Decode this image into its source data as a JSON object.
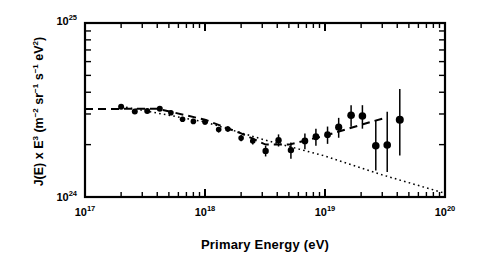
{
  "figure": {
    "kind": "scientific-plot",
    "xlabel": "Primary Energy (eV)",
    "ylabel_plain": "J(E) x E3 (m-2 sr-1 s-1 eV2)"
  },
  "ylabel_parts": {
    "j": "J(E) x E",
    "j_exp": "3",
    "open": " (m",
    "m_exp": "−2",
    "sr": " sr",
    "sr_exp": "−1",
    "s": " s",
    "s_exp": "−1",
    "ev": " eV",
    "ev_exp": "2",
    "close": ")"
  },
  "chart_data": {
    "type": "scatter",
    "title": "",
    "xlabel": "Primary Energy (eV)",
    "ylabel": "J(E) x E^3 (m^-2 sr^-1 s^-1 eV^2)",
    "xscale": "log",
    "yscale": "log",
    "xlim": [
      1e+17,
      1e+20
    ],
    "ylim": [
      1e+24,
      1e+25
    ],
    "xticks": [
      1e+17,
      1e+18,
      1e+19,
      1e+20
    ],
    "xticklabels": [
      "10^17",
      "10^18",
      "10^19",
      "10^20"
    ],
    "yticks": [
      1e+24,
      1e+25
    ],
    "yticklabels": [
      "10^24",
      "10^25"
    ],
    "grid": false,
    "legend": false,
    "marker": "filled-circle",
    "errorbars": "vertical, no caps",
    "points": [
      {
        "x": 2e+17,
        "y": 3.3e+24,
        "yerr_lo": 1e+23,
        "yerr_hi": 1e+23,
        "r": 3.0
      },
      {
        "x": 2.6e+17,
        "y": 3.1e+24,
        "yerr_lo": 9e+22,
        "yerr_hi": 9e+22,
        "r": 3.0
      },
      {
        "x": 3.3e+17,
        "y": 3.12e+24,
        "yerr_lo": 9e+22,
        "yerr_hi": 9e+22,
        "r": 3.0
      },
      {
        "x": 4.2e+17,
        "y": 3.22e+24,
        "yerr_lo": 9e+22,
        "yerr_hi": 9e+22,
        "r": 3.0
      },
      {
        "x": 5.2e+17,
        "y": 3.05e+24,
        "yerr_lo": 9e+22,
        "yerr_hi": 9e+22,
        "r": 2.8
      },
      {
        "x": 6.5e+17,
        "y": 2.8e+24,
        "yerr_lo": 9e+22,
        "yerr_hi": 9e+22,
        "r": 2.8
      },
      {
        "x": 8e+17,
        "y": 2.72e+24,
        "yerr_lo": 9e+22,
        "yerr_hi": 9e+22,
        "r": 2.8
      },
      {
        "x": 1e+18,
        "y": 2.7e+24,
        "yerr_lo": 9e+22,
        "yerr_hi": 9e+22,
        "r": 2.8
      },
      {
        "x": 1.3e+18,
        "y": 2.44e+24,
        "yerr_lo": 9e+22,
        "yerr_hi": 9e+22,
        "r": 2.8
      },
      {
        "x": 1.55e+18,
        "y": 2.46e+24,
        "yerr_lo": 9e+22,
        "yerr_hi": 9e+22,
        "r": 2.8
      },
      {
        "x": 2e+18,
        "y": 2.18e+24,
        "yerr_lo": 9e+22,
        "yerr_hi": 9e+22,
        "r": 2.8
      },
      {
        "x": 2.5e+18,
        "y": 2.1e+24,
        "yerr_lo": 1e+23,
        "yerr_hi": 1e+23,
        "r": 2.8
      },
      {
        "x": 3.2e+18,
        "y": 1.84e+24,
        "yerr_lo": 1.3e+23,
        "yerr_hi": 1.3e+23,
        "r": 3.2
      },
      {
        "x": 4.1e+18,
        "y": 2.12e+24,
        "yerr_lo": 1.7e+23,
        "yerr_hi": 1.7e+23,
        "r": 3.2
      },
      {
        "x": 5.2e+18,
        "y": 1.86e+24,
        "yerr_lo": 2e+23,
        "yerr_hi": 2e+23,
        "r": 3.2
      },
      {
        "x": 6.8e+18,
        "y": 2.1e+24,
        "yerr_lo": 2.2e+23,
        "yerr_hi": 2.2e+23,
        "r": 3.4
      },
      {
        "x": 8.4e+18,
        "y": 2.22e+24,
        "yerr_lo": 2.5e+23,
        "yerr_hi": 2.5e+23,
        "r": 3.4
      },
      {
        "x": 1.05e+19,
        "y": 2.28e+24,
        "yerr_lo": 2.6e+23,
        "yerr_hi": 2.6e+23,
        "r": 3.4
      },
      {
        "x": 1.3e+19,
        "y": 2.52e+24,
        "yerr_lo": 3.3e+23,
        "yerr_hi": 3.3e+23,
        "r": 3.6
      },
      {
        "x": 1.65e+19,
        "y": 2.95e+24,
        "yerr_lo": 4.2e+23,
        "yerr_hi": 4.2e+23,
        "r": 3.8
      },
      {
        "x": 2.05e+19,
        "y": 2.92e+24,
        "yerr_lo": 4.5e+23,
        "yerr_hi": 4.5e+23,
        "r": 3.8
      },
      {
        "x": 2.65e+19,
        "y": 1.97e+24,
        "yerr_lo": 5.5e+23,
        "yerr_hi": 8e+23,
        "r": 3.8
      },
      {
        "x": 3.3e+19,
        "y": 1.99e+24,
        "yerr_lo": 6e+23,
        "yerr_hi": 1.1e+24,
        "r": 3.8
      },
      {
        "x": 4.2e+19,
        "y": 2.78e+24,
        "yerr_lo": 1.05e+24,
        "yerr_hi": 1.4e+24,
        "r": 4.0
      }
    ],
    "fit_lines": [
      {
        "name": "dashed-fit",
        "style": "dashed",
        "description": "flat at low energy, dips through the ankle, then rises to high energy",
        "vertices": [
          {
            "x": 1e+17,
            "y": 3.2e+24
          },
          {
            "x": 4e+17,
            "y": 3.22e+24
          },
          {
            "x": 1e+18,
            "y": 2.78e+24
          },
          {
            "x": 2e+18,
            "y": 2.32e+24
          },
          {
            "x": 3.2e+18,
            "y": 2e+24
          },
          {
            "x": 5e+18,
            "y": 2e+24
          },
          {
            "x": 1e+19,
            "y": 2.25e+24
          },
          {
            "x": 2e+19,
            "y": 2.6e+24
          },
          {
            "x": 3e+19,
            "y": 2.82e+24
          }
        ]
      },
      {
        "name": "dotted-fit",
        "style": "dotted",
        "description": "single power law falling steadily across the whole range",
        "vertices": [
          {
            "x": 2.2e+17,
            "y": 3.28e+24
          },
          {
            "x": 1e+18,
            "y": 2.7e+24
          },
          {
            "x": 3.2e+18,
            "y": 2.12e+24
          },
          {
            "x": 1e+19,
            "y": 1.72e+24
          },
          {
            "x": 3e+19,
            "y": 1.34e+24
          },
          {
            "x": 1e+20,
            "y": 1.05e+24
          }
        ]
      }
    ]
  }
}
